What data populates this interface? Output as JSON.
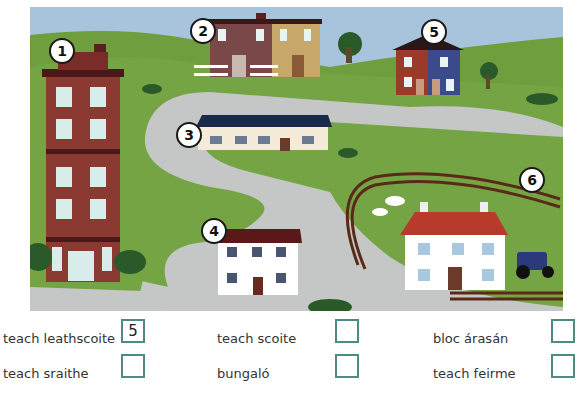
{
  "scene": {
    "badges": [
      {
        "number": "1",
        "target": "tall red apartment block"
      },
      {
        "number": "2",
        "target": "terraced houses with white picket fences"
      },
      {
        "number": "3",
        "target": "long single-storey house with navy roof"
      },
      {
        "number": "4",
        "target": "white two-storey detached house"
      },
      {
        "number": "5",
        "target": "red and blue semi-detached houses"
      },
      {
        "number": "6",
        "target": "farmhouse with cows, fence and tractor"
      }
    ],
    "colors": {
      "sky": "#a8c4dc",
      "grass": "#6f9e3e",
      "road": "#c5c7c6",
      "box_border": "#4e8a86"
    }
  },
  "answers": [
    {
      "label": "teach leathscoite",
      "value": "5"
    },
    {
      "label": "teach scoite",
      "value": ""
    },
    {
      "label": "bloc árasán",
      "value": ""
    },
    {
      "label": "teach sraithe",
      "value": ""
    },
    {
      "label": "bungaló",
      "value": ""
    },
    {
      "label": "teach feirme",
      "value": ""
    }
  ]
}
